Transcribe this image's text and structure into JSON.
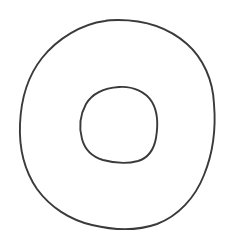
{
  "canvas": {
    "width": 236,
    "height": 247,
    "background_color": "#ffffff",
    "title": "Hand-drawn annulus sketch"
  },
  "drawing": {
    "style": "hand-drawn line art",
    "medium": "pen / ink outline",
    "subject": "annulus (ring / donut shape) formed by two concentric closed curves",
    "stroke_color": "#3a3a3a",
    "fill": "none",
    "shape_count": 2
  },
  "shapes": [
    {
      "name": "outer-circle",
      "label": "Outer circle",
      "kind": "closed-freehand-circle",
      "stroke_color": "#3a3a3a",
      "stroke_width": 1.9,
      "fill": "none",
      "center_x": 118,
      "center_y": 124,
      "radius_x": 97,
      "radius_y": 104,
      "bounds": {
        "left": 21,
        "top": 20,
        "right": 215,
        "bottom": 228
      },
      "path": "M 118 20 C 145 20 169 28 187 44 C 203 58 213 80 214 104 C 216 128 213 153 204 175 C 195 198 178 216 157 224 C 137 231 113 230 92 225 C 70 220 50 207 37 189 C 24 170 19 147 20 124 C 21 100 27 77 42 58 C 58 38 82 24 105 21 C 109 20 114 20 118 20 Z"
    },
    {
      "name": "inner-circle",
      "label": "Inner circle",
      "kind": "closed-freehand-circle",
      "stroke_color": "#3a3a3a",
      "stroke_width": 1.9,
      "fill": "none",
      "center_x": 119,
      "center_y": 124,
      "radius_x": 38,
      "radius_y": 38,
      "bounds": {
        "left": 81,
        "top": 87,
        "right": 157,
        "bottom": 162
      },
      "path": "M 119 87 C 133 86 146 92 152 102 C 158 112 158 126 156 138 C 154 149 148 158 138 161 C 127 164 114 163 103 160 C 93 157 85 150 82 139 C 79 128 80 115 86 104 C 92 94 104 88 119 87 Z"
    }
  ]
}
